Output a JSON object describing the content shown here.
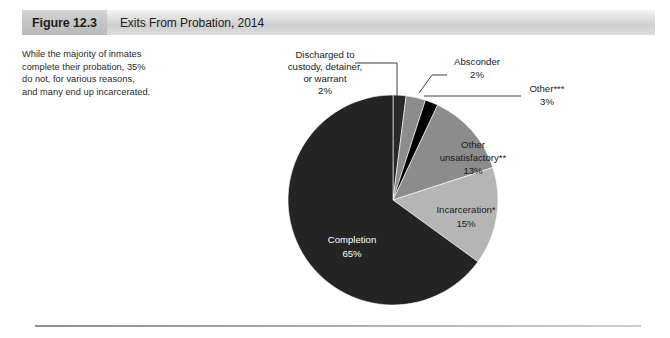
{
  "figure": {
    "number_label": "Figure 12.3",
    "title": "Exits From Probation, 2014"
  },
  "caption": {
    "line1": "While the majority of inmates",
    "line2": "complete their probation, 35%",
    "line3": "do not, for various reasons,",
    "line4": "and many end up incarcerated."
  },
  "colors": {
    "completion": "#242424",
    "incarceration": "#b5b5b5",
    "other_unsatisfactory": "#8c8c8c",
    "absconder": "#000000",
    "other": "#8c8c8c",
    "discharged": "#2a2a2a",
    "header_bar": "#d8d8d8",
    "page_background": "#ffffff",
    "rule": "#9a9a9a"
  },
  "labels": {
    "discharged_l1": "Discharged to",
    "discharged_l2": "custody, detainer,",
    "discharged_l3": "or warrant",
    "discharged_pct": "2%",
    "absconder_name": "Absconder",
    "absconder_pct": "2%",
    "other_name": "Other***",
    "other_pct": "3%",
    "other_unsat_l1": "Other",
    "other_unsat_l2": "unsatisfactory**",
    "other_unsat_pct": "13%",
    "incarceration_name": "Incarceration*",
    "incarceration_pct": "15%",
    "completion_name": "Completion",
    "completion_pct": "65%"
  },
  "chart_data": {
    "type": "pie",
    "title": "Exits From Probation, 2014",
    "start_angle_deg": 0,
    "direction": "clockwise",
    "legend": "none",
    "labels_position": "inside-and-callout",
    "center": [
      393,
      200
    ],
    "radius": 105,
    "categories": [
      "Discharged to custody, detainer, or warrant",
      "Other***",
      "Absconder",
      "Other unsatisfactory**",
      "Incarceration*",
      "Completion"
    ],
    "values": [
      2,
      3,
      2,
      13,
      15,
      65
    ],
    "unit": "percent",
    "slice_colors": [
      "#2a2a2a",
      "#8c8c8c",
      "#000000",
      "#8c8c8c",
      "#b5b5b5",
      "#242424"
    ],
    "slices": [
      {
        "label": "Discharged to custody, detainer, or warrant",
        "value": 2,
        "display": "2%",
        "color": "#2a2a2a",
        "label_placement": "callout"
      },
      {
        "label": "Other***",
        "value": 3,
        "display": "3%",
        "color": "#8c8c8c",
        "label_placement": "callout"
      },
      {
        "label": "Absconder",
        "value": 2,
        "display": "2%",
        "color": "#000000",
        "label_placement": "callout"
      },
      {
        "label": "Other unsatisfactory**",
        "value": 13,
        "display": "13%",
        "color": "#8c8c8c",
        "label_placement": "inside"
      },
      {
        "label": "Incarceration*",
        "value": 15,
        "display": "15%",
        "color": "#b5b5b5",
        "label_placement": "inside"
      },
      {
        "label": "Completion",
        "value": 65,
        "display": "65%",
        "color": "#242424",
        "label_placement": "inside"
      }
    ],
    "total": 100
  }
}
